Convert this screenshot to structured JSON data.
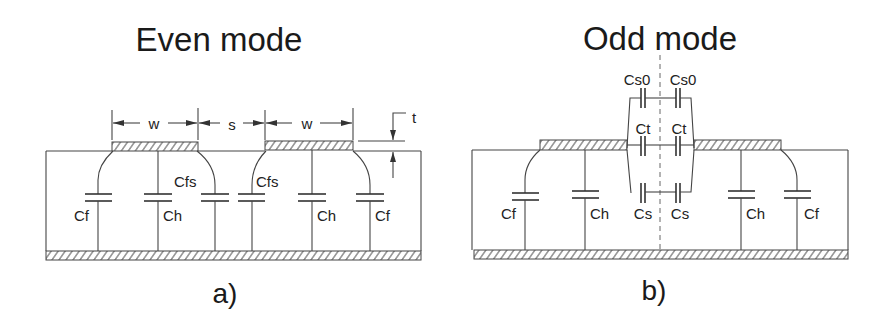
{
  "panels": {
    "even": {
      "title": "Even mode",
      "caption": "a)",
      "dimensions": {
        "w1": "w",
        "s": "s",
        "w2": "w",
        "t": "t"
      },
      "capacitors": {
        "cf_left": "Cf",
        "ch_left": "Ch",
        "cfs_left": "Cfs",
        "cfs_right": "Cfs",
        "ch_right": "Ch",
        "cf_right": "Cf"
      }
    },
    "odd": {
      "title": "Odd mode",
      "caption": "b)",
      "capacitors": {
        "cs0_left": "Cs0",
        "cs0_right": "Cs0",
        "ct_left": "Ct",
        "ct_right": "Ct",
        "cs_left": "Cs",
        "cs_right": "Cs",
        "cf_left": "Cf",
        "ch_left": "Ch",
        "ch_right": "Ch",
        "cf_right": "Cf"
      }
    }
  },
  "colors": {
    "line": "#444444",
    "text": "#1a1a1a",
    "background": "#ffffff"
  }
}
